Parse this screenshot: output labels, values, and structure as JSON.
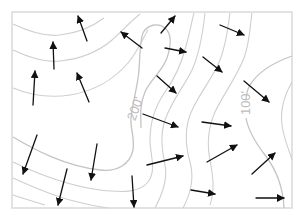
{
  "diagram": {
    "type": "contour-map-with-vector-field",
    "frame": {
      "x": 12,
      "y": 12,
      "width": 280,
      "height": 196,
      "stroke": "#d9d9d9"
    },
    "colors": {
      "contour": "#cfcfcf",
      "arrow": "#111111",
      "label": "#bdbdbd",
      "background": "#ffffff"
    },
    "contour_labels": [
      {
        "text": "200'",
        "x": 136,
        "y": 109,
        "rotate": -70
      },
      {
        "text": "100'",
        "x": 247,
        "y": 103,
        "rotate": -90
      }
    ],
    "contours": [
      {
        "id": "c-left-1",
        "d": "M13,24 C30,32 45,37 60,35 C78,33 92,27 104,18"
      },
      {
        "id": "c-left-2",
        "d": "M13,50 C30,58 45,63 60,61 C80,59 98,52 112,40 C122,31 130,22 140,14"
      },
      {
        "id": "c-left-3",
        "d": "M13,88 C30,95 50,98 70,95 C95,91 115,78 128,63 C138,51 142,40 148,30"
      },
      {
        "id": "c-200",
        "index": true,
        "d": "M13,137 C35,150 65,166 100,170 C118,172 130,164 133,150 C135,138 130,128 131,118 C133,100 138,85 139,70 C140,55 140,40 143,33 C147,25 158,22 165,28 C172,34 171,46 167,58 C162,72 150,80 145,92 C139,106 141,118 141,128"
      },
      {
        "id": "c-low-1",
        "d": "M13,162 C40,175 70,186 100,190 C125,193 140,192 148,182 C157,170 150,155 150,140 C150,120 156,105 165,92 C175,78 182,62 186,46 C190,32 192,20 194,13"
      },
      {
        "id": "c-low-2",
        "d": "M13,178 C35,188 55,196 70,200 C85,204 100,207 108,208"
      },
      {
        "id": "c-low-3",
        "d": "M13,195 C25,199 35,202 45,205"
      },
      {
        "id": "c-mid-1",
        "d": "M155,208 C162,195 168,180 165,165 C162,150 160,135 165,120 C172,100 185,85 192,70 C200,52 203,32 205,13"
      },
      {
        "id": "c-mid-2",
        "d": "M183,208 C190,195 195,180 190,162 C186,148 184,132 190,115 C197,96 212,80 220,60 C227,42 228,25 230,13"
      },
      {
        "id": "c-mid-3",
        "d": "M210,205 C215,190 213,176 210,160 C207,145 208,128 215,112 C223,95 236,78 244,58 C250,42 250,25 252,13"
      },
      {
        "id": "c-100",
        "index": true,
        "d": "M292,56 C275,62 258,72 250,85 C246,92 246,96 246,100 M246,118 C248,130 255,142 265,155 C275,168 283,185 284,208"
      },
      {
        "id": "c-right-1",
        "d": "M292,82 C284,96 280,110 282,125 C284,140 290,152 292,160"
      }
    ],
    "arrows": [
      {
        "x1": 87,
        "y1": 41,
        "x2": 78,
        "y2": 16
      },
      {
        "x1": 54,
        "y1": 69,
        "x2": 53,
        "y2": 42
      },
      {
        "x1": 33,
        "y1": 105,
        "x2": 35,
        "y2": 71
      },
      {
        "x1": 89,
        "y1": 102,
        "x2": 77,
        "y2": 73
      },
      {
        "x1": 142,
        "y1": 48,
        "x2": 121,
        "y2": 32
      },
      {
        "x1": 161,
        "y1": 33,
        "x2": 175,
        "y2": 16
      },
      {
        "x1": 165,
        "y1": 48,
        "x2": 186,
        "y2": 52
      },
      {
        "x1": 157,
        "y1": 76,
        "x2": 176,
        "y2": 93
      },
      {
        "x1": 220,
        "y1": 25,
        "x2": 244,
        "y2": 35
      },
      {
        "x1": 203,
        "y1": 57,
        "x2": 222,
        "y2": 72
      },
      {
        "x1": 244,
        "y1": 81,
        "x2": 269,
        "y2": 102
      },
      {
        "x1": 37,
        "y1": 135,
        "x2": 23,
        "y2": 174
      },
      {
        "x1": 67,
        "y1": 169,
        "x2": 58,
        "y2": 205
      },
      {
        "x1": 97,
        "y1": 144,
        "x2": 91,
        "y2": 180
      },
      {
        "x1": 143,
        "y1": 114,
        "x2": 178,
        "y2": 127
      },
      {
        "x1": 147,
        "y1": 165,
        "x2": 183,
        "y2": 156
      },
      {
        "x1": 132,
        "y1": 176,
        "x2": 134,
        "y2": 207
      },
      {
        "x1": 191,
        "y1": 190,
        "x2": 215,
        "y2": 194
      },
      {
        "x1": 202,
        "y1": 122,
        "x2": 231,
        "y2": 126
      },
      {
        "x1": 207,
        "y1": 162,
        "x2": 237,
        "y2": 145
      },
      {
        "x1": 252,
        "y1": 174,
        "x2": 275,
        "y2": 153
      },
      {
        "x1": 256,
        "y1": 198,
        "x2": 284,
        "y2": 198
      }
    ]
  }
}
